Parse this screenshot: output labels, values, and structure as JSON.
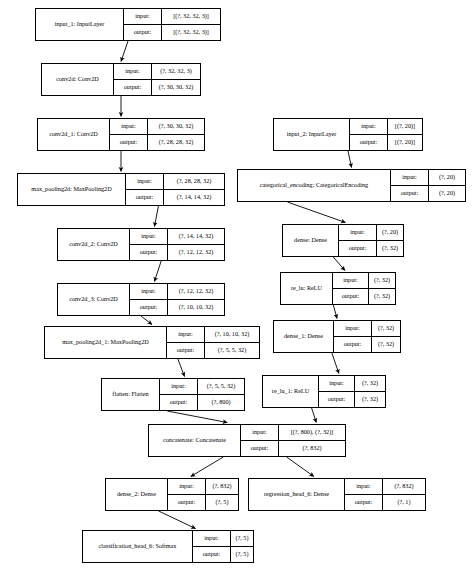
{
  "diagram": {
    "kind": "keras-model-plot",
    "io_labels": {
      "input": "input:",
      "output": "output:"
    },
    "nodes": [
      {
        "id": "input_1",
        "title": "input_1: InputLayer",
        "input": "[(?, 32, 32, 3)]",
        "output": "[(?, 32, 32, 3)]"
      },
      {
        "id": "conv2d",
        "title": "conv2d: Conv2D",
        "input": "(?, 32, 32, 3)",
        "output": "(?, 30, 30, 32)"
      },
      {
        "id": "conv2d_1",
        "title": "conv2d_1: Conv2D",
        "input": "(?, 30, 30, 32)",
        "output": "(?, 28, 28, 32)"
      },
      {
        "id": "max_pooling2d",
        "title": "max_pooling2d: MaxPooling2D",
        "input": "(?, 28, 28, 32)",
        "output": "(?, 14, 14, 32)"
      },
      {
        "id": "conv2d_2",
        "title": "conv2d_2: Conv2D",
        "input": "(?, 14, 14, 32)",
        "output": "(?, 12, 12, 32)"
      },
      {
        "id": "conv2d_3",
        "title": "conv2d_3: Conv2D",
        "input": "(?, 12, 12, 32)",
        "output": "(?, 10, 10, 32)"
      },
      {
        "id": "max_pooling2d_1",
        "title": "max_pooling2d_1: MaxPooling2D",
        "input": "(?, 10, 10, 32)",
        "output": "(?, 5, 5, 32)"
      },
      {
        "id": "flatten",
        "title": "flatten: Flatten",
        "input": "(?, 5, 5, 32)",
        "output": "(?, 800)"
      },
      {
        "id": "input_2",
        "title": "input_2: InputLayer",
        "input": "[(?, 20)]",
        "output": "[(?, 20)]"
      },
      {
        "id": "categorical_encoding",
        "title": "categorical_encoding: CategoricalEncoding",
        "input": "(?, 20)",
        "output": "(?, 20)"
      },
      {
        "id": "dense",
        "title": "dense: Dense",
        "input": "(?, 20)",
        "output": "(?, 32)"
      },
      {
        "id": "re_lu",
        "title": "re_lu: ReLU",
        "input": "(?, 32)",
        "output": "(?, 32)"
      },
      {
        "id": "dense_1",
        "title": "dense_1: Dense",
        "input": "(?, 32)",
        "output": "(?, 32)"
      },
      {
        "id": "re_lu_1",
        "title": "re_lu_1: ReLU",
        "input": "(?, 32)",
        "output": "(?, 32)"
      },
      {
        "id": "concatenate",
        "title": "concatenate: Concatenate",
        "input": "[(?, 800), (?, 32)]",
        "output": "(?, 832)"
      },
      {
        "id": "dense_2",
        "title": "dense_2: Dense",
        "input": "(?, 832)",
        "output": "(?, 5)"
      },
      {
        "id": "regression_head_6",
        "title": "regression_head_6: Dense",
        "input": "(?, 832)",
        "output": "(?, 1)"
      },
      {
        "id": "classification_head_6",
        "title": "classification_head_6: Softmax",
        "input": "(?, 5)",
        "output": "(?, 5)"
      }
    ],
    "edges": [
      {
        "from": "input_1",
        "to": "conv2d"
      },
      {
        "from": "conv2d",
        "to": "conv2d_1"
      },
      {
        "from": "conv2d_1",
        "to": "max_pooling2d"
      },
      {
        "from": "max_pooling2d",
        "to": "conv2d_2"
      },
      {
        "from": "conv2d_2",
        "to": "conv2d_3"
      },
      {
        "from": "conv2d_3",
        "to": "max_pooling2d_1"
      },
      {
        "from": "max_pooling2d_1",
        "to": "flatten"
      },
      {
        "from": "flatten",
        "to": "concatenate"
      },
      {
        "from": "input_2",
        "to": "categorical_encoding"
      },
      {
        "from": "categorical_encoding",
        "to": "dense"
      },
      {
        "from": "dense",
        "to": "re_lu"
      },
      {
        "from": "re_lu",
        "to": "dense_1"
      },
      {
        "from": "dense_1",
        "to": "re_lu_1"
      },
      {
        "from": "re_lu_1",
        "to": "concatenate"
      },
      {
        "from": "concatenate",
        "to": "dense_2"
      },
      {
        "from": "concatenate",
        "to": "regression_head_6"
      },
      {
        "from": "dense_2",
        "to": "classification_head_6"
      }
    ],
    "colors": {
      "stroke": "#000000",
      "fill": "#ffffff",
      "text": "#000000"
    }
  }
}
